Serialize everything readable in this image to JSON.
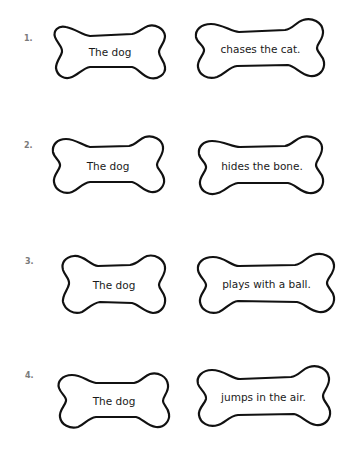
{
  "worksheet": {
    "items": [
      {
        "number": "1.",
        "subject": "The dog",
        "predicate": "chases the cat."
      },
      {
        "number": "2.",
        "subject": "The dog",
        "predicate": "hides the bone."
      },
      {
        "number": "3.",
        "subject": "The dog",
        "predicate": "plays with a ball."
      },
      {
        "number": "4.",
        "subject": "The dog",
        "predicate": "jumps in the air."
      }
    ],
    "shape": "bone-outline",
    "colors": {
      "outline": "#111111",
      "text": "#1a1a1a",
      "number": "#7a7a7a",
      "background": "#ffffff"
    }
  }
}
